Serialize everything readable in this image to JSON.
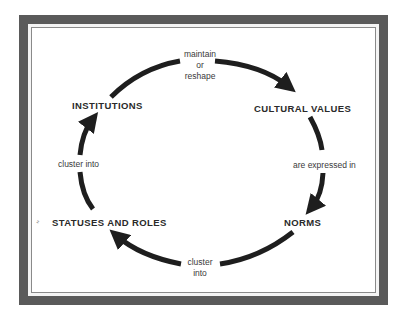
{
  "diagram": {
    "type": "cycle",
    "nodes": {
      "institutions": "INSTITUTIONS",
      "cultural_values": "CULTURAL VALUES",
      "norms": "NORMS",
      "statuses_roles": "STATUSES AND ROLES"
    },
    "edges": {
      "top": {
        "line1": "maintain",
        "line2": "or",
        "line3": "reshape",
        "from": "INSTITUTIONS",
        "to": "CULTURAL VALUES"
      },
      "right": {
        "label": "are expressed in",
        "from": "CULTURAL VALUES",
        "to": "NORMS"
      },
      "bottom": {
        "line1": "cluster",
        "line2": "into",
        "from": "NORMS",
        "to": "STATUSES AND ROLES"
      },
      "left": {
        "label": "cluster into",
        "from": "STATUSES AND ROLES",
        "to": "INSTITUTIONS"
      }
    },
    "margin_mark": "ʹʹ",
    "colors": {
      "frame": "#5a5a5a",
      "arrow": "#1e1e1e",
      "text": "#2a2a2a"
    }
  }
}
